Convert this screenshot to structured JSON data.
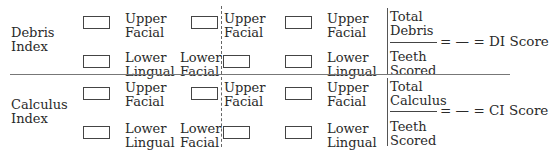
{
  "sections": [
    {
      "title_line1": "Debris",
      "title_line2": "Index",
      "upper_label": [
        "Upper",
        "Facial"
      ],
      "lower_lingual_label": [
        "Lower",
        "Lingual"
      ],
      "lower_facial_label": [
        "Lower",
        "Facial"
      ],
      "numerator": [
        "Total",
        "Debris"
      ],
      "denominator": [
        "Teeth",
        "Scored"
      ],
      "equation_tail": "= — = DI Score"
    },
    {
      "title_line1": "Calculus",
      "title_line2": "Index",
      "upper_label": [
        "Upper",
        "Facial"
      ],
      "lower_lingual_label": [
        "Lower",
        "Lingual"
      ],
      "lower_facial_label": [
        "Lower",
        "Facial"
      ],
      "numerator": [
        "Total",
        "Calculus"
      ],
      "denominator": [
        "Teeth",
        "Scored"
      ],
      "equation_tail": "= — = CI Score"
    }
  ]
}
